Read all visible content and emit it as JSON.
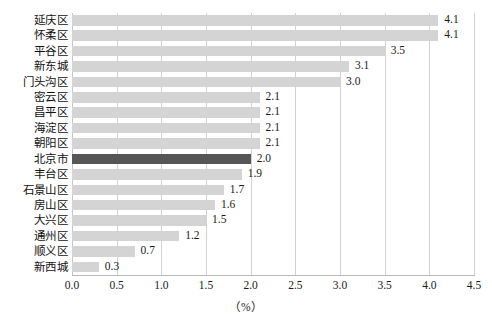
{
  "chart_data": {
    "type": "bar",
    "orientation": "horizontal",
    "title": "",
    "subtitle": "",
    "xlabel": "（%）",
    "ylabel": "",
    "xlim": [
      0.0,
      4.5
    ],
    "xticks": [
      "0.0",
      "0.5",
      "1.0",
      "1.5",
      "2.0",
      "2.5",
      "3.0",
      "3.5",
      "4.0",
      "4.5"
    ],
    "xtick_values": [
      0.0,
      0.5,
      1.0,
      1.5,
      2.0,
      2.5,
      3.0,
      3.5,
      4.0,
      4.5
    ],
    "grid": "vertical",
    "legend": "none",
    "categories": [
      "延庆区",
      "怀柔区",
      "平谷区",
      "新东城",
      "门头沟区",
      "密云区",
      "昌平区",
      "海淀区",
      "朝阳区",
      "北京市",
      "丰台区",
      "石景山区",
      "房山区",
      "大兴区",
      "通州区",
      "顺义区",
      "新西城"
    ],
    "values": [
      4.1,
      4.1,
      3.5,
      3.1,
      3.0,
      2.1,
      2.1,
      2.1,
      2.1,
      2.0,
      1.9,
      1.7,
      1.6,
      1.5,
      1.2,
      0.7,
      0.3
    ],
    "data_labels": [
      "4.1",
      "4.1",
      "3.5",
      "3.1",
      "3.0",
      "2.1",
      "2.1",
      "2.1",
      "2.1",
      "2.0",
      "1.9",
      "1.7",
      "1.6",
      "1.5",
      "1.2",
      "0.7",
      "0.3"
    ],
    "highlighted_category": "北京市",
    "colors": {
      "bar": "#d4d4d4",
      "bar_highlight": "#565656",
      "gridline": "#d2d2d2",
      "axis": "#b9b9b9",
      "text": "#1a1a1a",
      "background": "#ffffff"
    }
  }
}
